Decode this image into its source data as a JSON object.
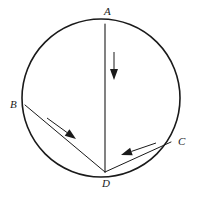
{
  "figure": {
    "kind": "geometry-diagram",
    "background_color": "#ffffff",
    "stroke_color": "#1a1a1a",
    "circle": {
      "center_x": 101,
      "center_y": 98,
      "radius": 79,
      "stroke_width": 1.6
    },
    "points": [
      {
        "id": "A",
        "label": "A",
        "x": 105,
        "y": 24,
        "label_x": 104,
        "label_y": 6,
        "role": "top-of-circle"
      },
      {
        "id": "B",
        "label": "B",
        "x": 25,
        "y": 105,
        "label_x": 10,
        "label_y": 99,
        "role": "left-of-circle"
      },
      {
        "id": "C",
        "label": "C",
        "x": 171,
        "y": 142,
        "label_x": 178,
        "label_y": 136,
        "role": "right-of-circle"
      },
      {
        "id": "D",
        "label": "D",
        "x": 105,
        "y": 172,
        "label_x": 102,
        "label_y": 178,
        "role": "bottom-of-circle"
      }
    ],
    "chords": [
      {
        "id": "AD",
        "from": "A",
        "to": "D",
        "x1": 105,
        "y1": 24,
        "x2": 105,
        "y2": 172,
        "stroke_width": 1.1
      },
      {
        "id": "BD",
        "from": "B",
        "to": "D",
        "x1": 25,
        "y1": 105,
        "x2": 105,
        "y2": 172,
        "stroke_width": 1.0
      },
      {
        "id": "CD",
        "from": "C",
        "to": "D",
        "x1": 171,
        "y1": 142,
        "x2": 105,
        "y2": 172,
        "stroke_width": 1.0
      }
    ],
    "arrows": [
      {
        "id": "arrow-ad",
        "along_chord": "AD",
        "direction": "down",
        "points_toward": "D",
        "x1": 114,
        "y1": 52,
        "x2": 114,
        "y2": 80,
        "stroke_width": 1.0,
        "head_length": 11,
        "head_width": 8
      },
      {
        "id": "arrow-bd",
        "along_chord": "BD",
        "direction": "down-right",
        "points_toward": "D",
        "x1": 47,
        "y1": 118,
        "x2": 76,
        "y2": 139,
        "stroke_width": 1.0,
        "head_length": 11,
        "head_width": 8
      },
      {
        "id": "arrow-cd",
        "along_chord": "CD",
        "direction": "left",
        "points_toward": "D",
        "x1": 156,
        "y1": 143,
        "x2": 121,
        "y2": 155,
        "stroke_width": 1.0,
        "head_length": 11,
        "head_width": 8
      }
    ]
  }
}
